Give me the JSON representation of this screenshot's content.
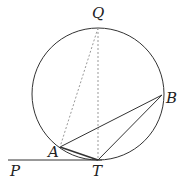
{
  "diagram": {
    "circle": {
      "cx": 98,
      "cy": 94,
      "r": 66
    },
    "points": {
      "Q": {
        "label": "Q",
        "x": 98,
        "y": 28
      },
      "A": {
        "label": "A",
        "x": 60,
        "y": 147
      },
      "B": {
        "label": "B",
        "x": 162,
        "y": 95
      },
      "T": {
        "label": "T",
        "x": 98,
        "y": 160
      },
      "P": {
        "label": "P",
        "x": 10,
        "y": 160
      }
    },
    "solid_segments": [
      [
        "P",
        "T"
      ],
      [
        "A",
        "B"
      ],
      [
        "A",
        "T"
      ],
      [
        "T",
        "B"
      ]
    ],
    "dashed_segments": [
      [
        "Q",
        "A"
      ],
      [
        "Q",
        "T"
      ]
    ],
    "colors": {
      "stroke": "#333333",
      "dashed": "#999999"
    }
  }
}
